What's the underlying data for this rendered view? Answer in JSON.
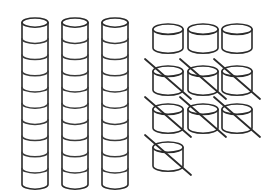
{
  "figure": {
    "background_color": "#ffffff",
    "stroke_color": "#2b2b2b",
    "segment_stroke_color": "#3a3a3a"
  },
  "stacks": {
    "label": "tall cylinder stacks",
    "count": 3,
    "segments_per_stack": 10,
    "total_cylinders": 30,
    "items": [
      {
        "name": "stack-1",
        "x": 22,
        "top": 18,
        "width": 26,
        "segments": 10
      },
      {
        "name": "stack-2",
        "x": 62,
        "top": 18,
        "width": 26,
        "segments": 10
      },
      {
        "name": "stack-3",
        "x": 102,
        "top": 18,
        "width": 26,
        "segments": 10
      }
    ],
    "segment_height": 16.2,
    "ellipse_ry": 4.6
  },
  "single_cylinders": {
    "label": "single cylinder grid",
    "columns_x": [
      153,
      188,
      222
    ],
    "rows_y": [
      24,
      66,
      104,
      142
    ],
    "width": 30,
    "height": 24,
    "ellipse_ry": 5.2,
    "total": 10,
    "crossed_out_total": 7,
    "plain_total": 3,
    "grid": [
      [
        {
          "name": "cylinder-r1c1",
          "crossed": false
        },
        {
          "name": "cylinder-r1c2",
          "crossed": false
        },
        {
          "name": "cylinder-r1c3",
          "crossed": false
        }
      ],
      [
        {
          "name": "cylinder-r2c1",
          "crossed": true
        },
        {
          "name": "cylinder-r2c2",
          "crossed": true
        },
        {
          "name": "cylinder-r2c3",
          "crossed": true
        }
      ],
      [
        {
          "name": "cylinder-r3c1",
          "crossed": true
        },
        {
          "name": "cylinder-r3c2",
          "crossed": true
        },
        {
          "name": "cylinder-r3c3",
          "crossed": true
        }
      ],
      [
        {
          "name": "cylinder-r4c1",
          "crossed": true
        }
      ]
    ]
  }
}
